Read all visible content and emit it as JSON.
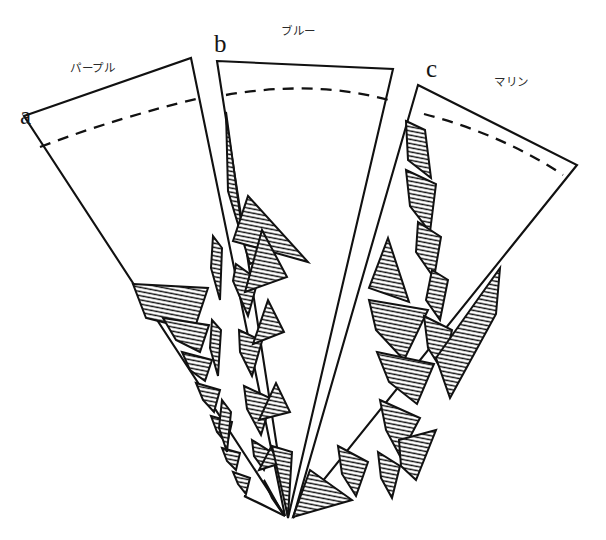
{
  "figure": {
    "background_color": "#ffffff",
    "line_color": "#111111",
    "hatch_color": "#111111",
    "width": 606,
    "height": 540
  },
  "labels": {
    "letters": [
      {
        "id": "a",
        "text": "a",
        "x": 20,
        "y": 124
      },
      {
        "id": "b",
        "text": "b",
        "x": 214,
        "y": 52
      },
      {
        "id": "c",
        "text": "c",
        "x": 426,
        "y": 77
      }
    ],
    "names": [
      {
        "id": "sector-a-name",
        "text": "パープル",
        "x": 70,
        "y": 72
      },
      {
        "id": "sector-b-name",
        "text": "ブルー",
        "x": 281,
        "y": 35
      },
      {
        "id": "sector-c-name",
        "text": "マリン",
        "x": 494,
        "y": 86
      }
    ]
  },
  "sectors": [
    {
      "id": "a",
      "letter": "a",
      "name": "パープル",
      "name_romaji": "purple",
      "outline": "M 24,116 L 191,58 L 285,516 Z",
      "dashed_arc": "M 40,147 C 95,126 150,110 196,99"
    },
    {
      "id": "b",
      "letter": "b",
      "name": "ブルー",
      "name_romaji": "blue",
      "outline": "M 217,61 L 393,69 L 288,518 Z",
      "dashed_arc": "M 226,95 C 283,85 341,86 392,101"
    },
    {
      "id": "c",
      "letter": "c",
      "name": "マリン",
      "name_romaji": "marine",
      "outline": "M 418,85 L 577,165 L 293,518 Z",
      "dashed_arc": "M 424,114 C 470,126 520,146 563,175"
    }
  ],
  "hatching": {
    "pattern": "diagonal-lines",
    "angle_deg": 12,
    "spacing_px": 4,
    "stroke_width": 1.35
  },
  "hatched_regions": [
    {
      "id": "b-tri-1",
      "sector": "b",
      "points": "226,112 242,229 270,254 250,264 228,191"
    },
    {
      "id": "b-tri-2",
      "sector": "b",
      "points": "248,196 308,262 233,241"
    },
    {
      "id": "b-tri-3",
      "sector": "b",
      "points": "236,264 258,280 248,316 233,281"
    },
    {
      "id": "b-tri-4",
      "sector": "b",
      "points": "245,292 287,277 262,230"
    },
    {
      "id": "b-tri-5",
      "sector": "b",
      "points": "239,330 262,341 252,376 240,352"
    },
    {
      "id": "b-tri-6",
      "sector": "b",
      "points": "253,344 284,332 268,300"
    },
    {
      "id": "b-tri-7",
      "sector": "b",
      "points": "244,386 272,399 261,435 247,409"
    },
    {
      "id": "b-tri-8",
      "sector": "b",
      "points": "259,420 290,412 276,383"
    },
    {
      "id": "b-tri-9",
      "sector": "b",
      "points": "252,440 271,452 264,470 254,456"
    },
    {
      "id": "b-tri-10",
      "sector": "b",
      "points": "259,470 278,464 271,447"
    },
    {
      "id": "b-tri-11",
      "sector": "b",
      "points": "264,480 283,514 272,498"
    },
    {
      "id": "b-tip",
      "sector": "b",
      "points": "272,446 292,452 288,517"
    },
    {
      "id": "a-tri-big",
      "sector": "a",
      "points": "133,284 208,288 194,330 146,318"
    },
    {
      "id": "a-tri-2",
      "sector": "a",
      "points": "163,318 209,325 200,352 176,340"
    },
    {
      "id": "a-tri-3",
      "sector": "a",
      "points": "182,352 212,360 205,381 190,370"
    },
    {
      "id": "a-tri-4",
      "sector": "a",
      "points": "196,383 220,390 214,412 203,400"
    },
    {
      "id": "a-tri-5",
      "sector": "a",
      "points": "211,416 232,422 227,444 217,432"
    },
    {
      "id": "a-tri-6",
      "sector": "a",
      "points": "222,448 240,453 236,470 227,461"
    },
    {
      "id": "a-tri-7",
      "sector": "a",
      "points": "233,472 250,478 246,494 238,484"
    },
    {
      "id": "a-tri-8",
      "sector": "a",
      "points": "244,496 261,504 285,516"
    },
    {
      "id": "c-tri-1",
      "sector": "c",
      "points": "406,121 425,130 431,178 408,160"
    },
    {
      "id": "c-tri-2",
      "sector": "c",
      "points": "406,170 436,184 430,232 410,206"
    },
    {
      "id": "c-tri-3",
      "sector": "c",
      "points": "418,222 441,237 434,278 416,252"
    },
    {
      "id": "c-tri-4",
      "sector": "c",
      "points": "388,238 409,302 369,288"
    },
    {
      "id": "c-tri-5",
      "sector": "c",
      "points": "369,300 428,310 404,360 376,330"
    },
    {
      "id": "c-tri-6",
      "sector": "c",
      "points": "377,352 434,364 417,404 389,382"
    },
    {
      "id": "c-tri-7",
      "sector": "c",
      "points": "380,400 420,418 400,456 386,430"
    },
    {
      "id": "c-tri-8",
      "sector": "c",
      "points": "432,270 448,280 440,320 426,300"
    },
    {
      "id": "c-tri-9",
      "sector": "c",
      "points": "424,316 452,330 443,372 428,348"
    },
    {
      "id": "c-tri-10",
      "sector": "c",
      "points": "436,358 500,268 496,314 450,398"
    },
    {
      "id": "c-tri-11",
      "sector": "c",
      "points": "399,440 436,430 416,480 401,466"
    },
    {
      "id": "c-tri-12",
      "sector": "c",
      "points": "378,452 400,466 392,498 381,478"
    },
    {
      "id": "c-tri-13",
      "sector": "c",
      "points": "338,446 368,462 356,496 342,474"
    },
    {
      "id": "c-tip",
      "sector": "c",
      "points": "310,470 352,500 293,517"
    },
    {
      "id": "b-left-sliver",
      "sector": "b",
      "points": "213,236 222,248 220,300 211,268"
    },
    {
      "id": "b-left-sliver2",
      "sector": "b",
      "points": "212,320 221,330 218,376 210,348"
    },
    {
      "id": "a-sliver-lower",
      "sector": "a",
      "points": "222,400 231,412 227,452 219,428"
    }
  ]
}
